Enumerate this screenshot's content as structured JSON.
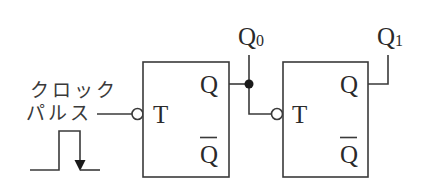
{
  "diagram": {
    "type": "T flip-flop 2-bit ripple counter",
    "clock_label_line1": "クロック",
    "clock_label_line2": "パルス",
    "flipflops": [
      {
        "name": "FF0",
        "input_label": "T",
        "output_label": "Q",
        "output_bar_label": "Q",
        "output_name": "Q",
        "output_subscript": "0"
      },
      {
        "name": "FF1",
        "input_label": "T",
        "output_label": "Q",
        "output_bar_label": "Q",
        "output_name": "Q",
        "output_subscript": "1"
      }
    ],
    "clock_waveform": "single positive pulse with falling-edge arrow",
    "colors": {
      "line": "#3a3a3a",
      "junction": "#1a1a1a",
      "background": "#ffffff"
    }
  }
}
